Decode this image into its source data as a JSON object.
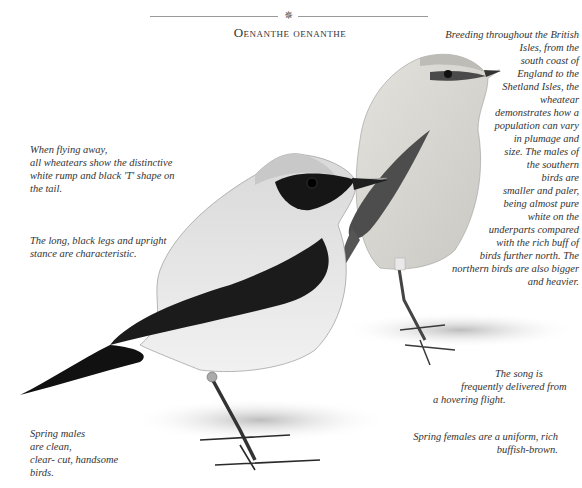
{
  "header": {
    "ornament": "✵",
    "title": "Oenanthe oenanthe"
  },
  "captions": {
    "flying": "When flying away, all wheatears show the distinctive white rump and black 'T' shape on the tail.",
    "flying_lines": [
      "When flying away,",
      "all wheatears show the distinctive",
      "white rump and black 'T' shape on",
      "the tail."
    ],
    "legs_lines": [
      "The long, black legs and upright",
      "stance are characteristic."
    ],
    "spring_males_lines": [
      "Spring males",
      "are clean,",
      "clear- cut, handsome",
      "birds."
    ],
    "breeding_lines": [
      "Breeding throughout the British",
      "Isles, from the",
      "south coast of",
      "England to the",
      "Shetland Isles, the",
      "wheatear",
      "demonstrates how a",
      "population can vary",
      "in plumage and",
      "size. The males of",
      "the southern",
      "birds are",
      "smaller and paler,",
      "being almost pure",
      "white on the",
      "underparts compared",
      "with the rich buff of",
      "birds further north. The",
      "northern birds are also bigger",
      "and heavier."
    ],
    "song_lines": [
      "The song is",
      "frequently delivered from",
      "a hovering flight."
    ],
    "spring_females_lines": [
      "Spring females are a uniform, rich",
      "buffish-brown."
    ]
  },
  "illustrations": {
    "male": "male-wheatear-illustration",
    "female": "female-wheatear-illustration"
  }
}
